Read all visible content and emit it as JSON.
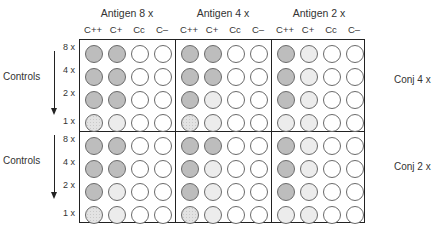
{
  "antigen_headers": [
    "Antigen 8 x",
    "Antigen 4 x",
    "Antigen 2 x"
  ],
  "column_labels": [
    "C++",
    "C+",
    "Cc",
    "C–"
  ],
  "row_labels": [
    "8 x",
    "4 x",
    "2 x",
    "1 x"
  ],
  "controls_label": "Controls",
  "conjugate_labels": [
    "Conj 4 x",
    "Conj 2 x"
  ],
  "legend_fills": {
    "dark": "#bdbdbd",
    "light": "#ececec",
    "dotted": "#e3e3e3",
    "none": "#ffffff"
  },
  "plates": [
    {
      "conj": "Conj 4 x",
      "blocks": [
        {
          "antigen": "Antigen 8 x",
          "rows": [
            [
              "dark",
              "dark",
              "none",
              "none"
            ],
            [
              "dark",
              "dark",
              "none",
              "none"
            ],
            [
              "dark",
              "dark",
              "none",
              "none"
            ],
            [
              "dot",
              "light",
              "none",
              "none"
            ]
          ]
        },
        {
          "antigen": "Antigen 4 x",
          "rows": [
            [
              "dark",
              "dark",
              "none",
              "none"
            ],
            [
              "dark",
              "dark",
              "none",
              "none"
            ],
            [
              "dark",
              "light",
              "none",
              "none"
            ],
            [
              "dot",
              "light",
              "none",
              "none"
            ]
          ]
        },
        {
          "antigen": "Antigen 2 x",
          "rows": [
            [
              "dark",
              "light",
              "none",
              "none"
            ],
            [
              "dark",
              "light",
              "none",
              "none"
            ],
            [
              "dark",
              "light",
              "none",
              "none"
            ],
            [
              "light",
              "light",
              "none",
              "none"
            ]
          ]
        }
      ]
    },
    {
      "conj": "Conj 2 x",
      "blocks": [
        {
          "antigen": "Antigen 8 x",
          "rows": [
            [
              "dark",
              "dark",
              "none",
              "none"
            ],
            [
              "dark",
              "dark",
              "none",
              "none"
            ],
            [
              "dark",
              "light",
              "none",
              "none"
            ],
            [
              "dot",
              "light",
              "none",
              "none"
            ]
          ]
        },
        {
          "antigen": "Antigen 4 x",
          "rows": [
            [
              "dark",
              "dark",
              "none",
              "none"
            ],
            [
              "dark",
              "light",
              "none",
              "none"
            ],
            [
              "dark",
              "light",
              "none",
              "none"
            ],
            [
              "dot",
              "light",
              "none",
              "none"
            ]
          ]
        },
        {
          "antigen": "Antigen 2 x",
          "rows": [
            [
              "dark",
              "light",
              "none",
              "none"
            ],
            [
              "dark",
              "light",
              "none",
              "none"
            ],
            [
              "dark",
              "light",
              "none",
              "none"
            ],
            [
              "light",
              "light",
              "none",
              "none"
            ]
          ]
        }
      ]
    }
  ]
}
